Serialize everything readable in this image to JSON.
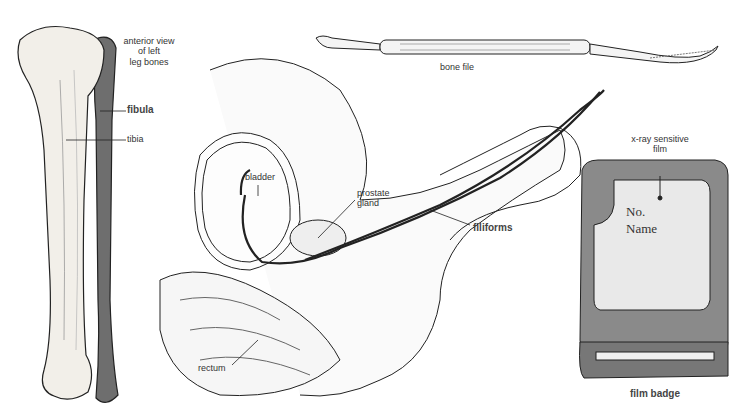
{
  "figure": {
    "panels": [
      {
        "id": "leg-bones",
        "caption": "anterior view of left leg bones",
        "caption_lines": [
          "anterior view",
          "of left",
          "leg bones"
        ],
        "labels": [
          "fibula",
          "tibia"
        ]
      },
      {
        "id": "pelvic-section",
        "labels": [
          "bladder",
          "prostate gland",
          "filiforms",
          "rectum"
        ],
        "prostate_lines": [
          "prostate",
          "gland"
        ]
      },
      {
        "id": "bone-file",
        "caption": "bone file"
      },
      {
        "id": "film-badge",
        "caption": "film badge",
        "pointer_label": "x-ray sensitive film",
        "pointer_lines": [
          "x-ray sensitive",
          "film"
        ],
        "film_text": [
          "No.",
          "Name"
        ]
      }
    ],
    "colors": {
      "ink": "#222222",
      "bone_fill": "#f2efe9",
      "badge_body": "#8a8a8a",
      "film_fill": "#e9e9e9"
    }
  }
}
